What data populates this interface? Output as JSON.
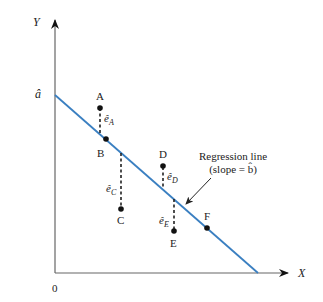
{
  "diagram": {
    "axes": {
      "y_label": "Y",
      "x_label": "X",
      "origin_label": "0",
      "intercept_label": "â"
    },
    "regression_line": {
      "label_line1": "Regression line",
      "label_line2": "(slope = b̂)",
      "color": "#3a7fc1"
    },
    "points": [
      {
        "label": "A",
        "residual_label": "ê",
        "residual_sub": "A"
      },
      {
        "label": "B"
      },
      {
        "label": "C",
        "residual_label": "ê",
        "residual_sub": "C"
      },
      {
        "label": "D",
        "residual_label": "ê",
        "residual_sub": "D"
      },
      {
        "label": "E",
        "residual_label": "ê",
        "residual_sub": "E"
      },
      {
        "label": "F"
      }
    ],
    "colors": {
      "axis": "#555555",
      "point": "#111111",
      "residual": "#222222"
    }
  }
}
